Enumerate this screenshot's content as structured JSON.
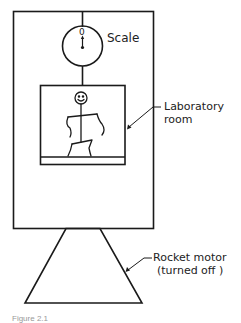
{
  "diagram": {
    "labels": {
      "scale": "Scale",
      "scale_reading": "0",
      "laboratory_line1": "Laboratory",
      "laboratory_line2": "room",
      "rocket_line1": "Rocket motor",
      "rocket_line2": "(turned off )"
    },
    "caption": "Figure 2.1",
    "colors": {
      "stroke": "#1a1a1a",
      "background": "#ffffff"
    }
  }
}
